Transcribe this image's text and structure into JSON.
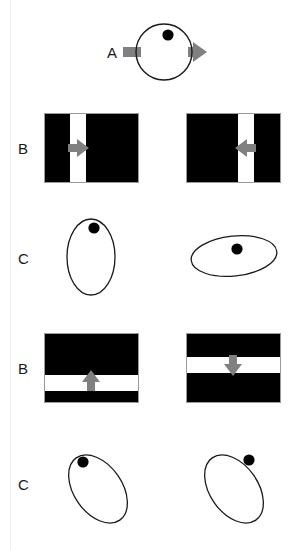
{
  "figure": {
    "width": 303,
    "height": 550,
    "background": "#ffffff",
    "stroke_color": "#1a1a1a",
    "fill_black": "#000000",
    "arrow_gray": "#808080",
    "stripe_white": "#ffffff",
    "rule_color": "#f0f0f0"
  },
  "labels": {
    "a": "A",
    "b1": "B",
    "c1": "C",
    "b2": "B",
    "c2": "C"
  },
  "rows": [
    {
      "id": "row-a",
      "label": "A",
      "kind": "circle-with-arrow",
      "panels": [
        {
          "id": "a-circle",
          "shape": "circle",
          "dot": "top-center-right",
          "arrow": "right",
          "arrow_direction_degrees": 0
        }
      ]
    },
    {
      "id": "row-b-1",
      "label": "B",
      "kind": "grating",
      "panels": [
        {
          "id": "b1-left",
          "stripe_orientation": "vertical",
          "stripe_position_percent": 33,
          "arrow": "right",
          "arrow_direction_degrees": 0
        },
        {
          "id": "b1-right",
          "stripe_orientation": "vertical",
          "stripe_position_percent": 60,
          "arrow": "left",
          "arrow_direction_degrees": 180
        }
      ]
    },
    {
      "id": "row-c-1",
      "label": "C",
      "kind": "ellipse",
      "panels": [
        {
          "id": "c1-left",
          "ellipse_orientation": "vertical",
          "tilt_degrees": 0,
          "dot": "upper-center"
        },
        {
          "id": "c1-right",
          "ellipse_orientation": "horizontal",
          "tilt_degrees": -6,
          "dot": "center"
        }
      ]
    },
    {
      "id": "row-b-2",
      "label": "B",
      "kind": "grating",
      "panels": [
        {
          "id": "b2-left",
          "stripe_orientation": "horizontal",
          "stripe_position_percent": 70,
          "arrow": "up",
          "arrow_direction_degrees": 90
        },
        {
          "id": "b2-right",
          "stripe_orientation": "horizontal",
          "stripe_position_percent": 42,
          "arrow": "down",
          "arrow_direction_degrees": 270
        }
      ]
    },
    {
      "id": "row-c-2",
      "label": "C",
      "kind": "ellipse",
      "panels": [
        {
          "id": "c2-left",
          "ellipse_orientation": "oblique",
          "tilt_degrees": -35,
          "dot": "upper-left"
        },
        {
          "id": "c2-right",
          "ellipse_orientation": "oblique",
          "tilt_degrees": -35,
          "dot": "upper-right"
        }
      ]
    }
  ]
}
